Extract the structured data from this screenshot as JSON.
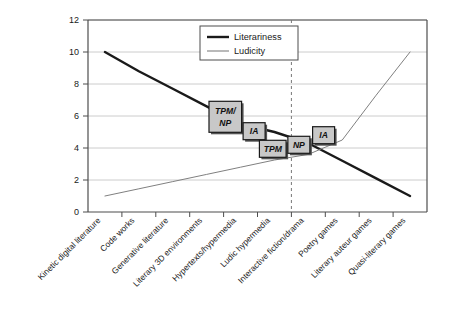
{
  "chart_data": {
    "type": "line",
    "title": "",
    "xlabel": "",
    "ylabel": "",
    "ylim": [
      0,
      12
    ],
    "yticks": [
      0,
      2,
      4,
      6,
      8,
      10,
      12
    ],
    "grid": true,
    "legend_position": "top-center",
    "categories": [
      "Kinetic digital literature",
      "Code works",
      "Generative literature",
      "Literary 3D environments",
      "Hypertexts/hypermedia",
      "Ludic hypermedia",
      "Interactive fiction/drama",
      "Poetry games",
      "Literary auteur games",
      "Quasi-literary games"
    ],
    "series": [
      {
        "name": "Literariness",
        "color": "#1a1a1a",
        "width": 2.4,
        "values": [
          10.0,
          8.8,
          7.7,
          6.6,
          5.5,
          5.0,
          4.3,
          3.2,
          2.1,
          1.0
        ]
      },
      {
        "name": "Ludicity",
        "color": "#808080",
        "width": 1.0,
        "values": [
          1.0,
          1.45,
          1.9,
          2.35,
          2.8,
          3.25,
          3.6,
          4.5,
          7.3,
          10.0
        ]
      }
    ],
    "annotations": [
      {
        "label": "TPM/\nNP",
        "lines": [
          "TPM/",
          "NP"
        ],
        "x": 4.05,
        "y": 5.95
      },
      {
        "label": "IA",
        "lines": [
          "IA"
        ],
        "x": 4.9,
        "y": 5.05
      },
      {
        "label": "TPM",
        "lines": [
          "TPM"
        ],
        "x": 5.45,
        "y": 3.95
      },
      {
        "label": "NP",
        "lines": [
          "NP"
        ],
        "x": 6.22,
        "y": 4.2
      },
      {
        "label": "IA",
        "lines": [
          "IA"
        ],
        "x": 6.95,
        "y": 4.8
      }
    ],
    "divider": {
      "type": "vertical-dashed",
      "x_category_boundary": 6,
      "color": "#777777"
    }
  },
  "legend": {
    "entries": [
      {
        "label": "Literariness"
      },
      {
        "label": "Ludicity"
      }
    ]
  },
  "axis": {
    "y_tick_labels": [
      "0",
      "2",
      "4",
      "6",
      "8",
      "10",
      "12"
    ]
  }
}
